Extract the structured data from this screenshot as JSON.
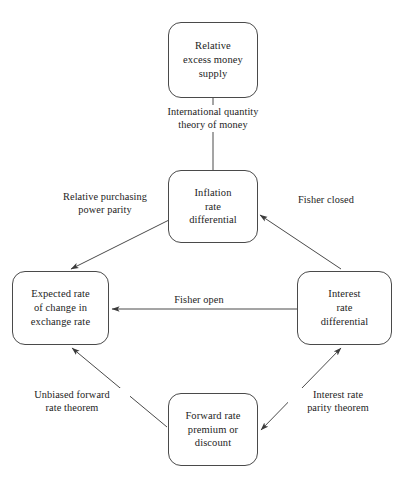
{
  "diagram": {
    "type": "cycle-flow-diagram",
    "colors": {
      "background": "#ffffff",
      "node_border": "#4a4a4a",
      "edge_stroke": "#4a4a4a",
      "text": "#232323"
    },
    "nodes": [
      {
        "id": "relative-excess-money-supply",
        "label": "Relative\nexcess money\nsupply",
        "position": "top"
      },
      {
        "id": "inflation-rate-differential",
        "label": "Inflation\nrate\ndifferential",
        "position": "upper-center"
      },
      {
        "id": "expected-rate-of-change-in-exchange-rate",
        "label": "Expected rate\nof change in\nexchange rate",
        "position": "left"
      },
      {
        "id": "interest-rate-differential",
        "label": "Interest\nrate\ndifferential",
        "position": "right"
      },
      {
        "id": "forward-rate-premium-or-discount",
        "label": "Forward rate\npremium or\ndiscount",
        "position": "bottom"
      }
    ],
    "edges": [
      {
        "id": "international-quantity-theory-of-money",
        "label": "International quantity\ntheory of money",
        "from": "relative-excess-money-supply",
        "to": "inflation-rate-differential",
        "arrowheads": "none",
        "orientation": "vertical"
      },
      {
        "id": "relative-purchasing-power-parity",
        "label": "Relative purchasing\npower parity",
        "from": "inflation-rate-differential",
        "to": "expected-rate-of-change-in-exchange-rate",
        "arrowheads": "end",
        "orientation": "diagonal-down-left"
      },
      {
        "id": "fisher-closed",
        "label": "Fisher closed",
        "from": "interest-rate-differential",
        "to": "inflation-rate-differential",
        "arrowheads": "end",
        "orientation": "diagonal-up-left"
      },
      {
        "id": "fisher-open",
        "label": "Fisher open",
        "from": "interest-rate-differential",
        "to": "expected-rate-of-change-in-exchange-rate",
        "arrowheads": "end",
        "orientation": "horizontal-left"
      },
      {
        "id": "unbiased-forward-rate-theorem",
        "label": "Unbiased forward\nrate theorem",
        "from": "forward-rate-premium-or-discount",
        "to": "expected-rate-of-change-in-exchange-rate",
        "arrowheads": "end",
        "orientation": "diagonal-up-left"
      },
      {
        "id": "interest-rate-parity-theorem",
        "label": "Interest rate\nparity theorem",
        "from": "forward-rate-premium-or-discount",
        "to": "interest-rate-differential",
        "arrowheads": "both",
        "orientation": "diagonal-up-right"
      }
    ]
  }
}
